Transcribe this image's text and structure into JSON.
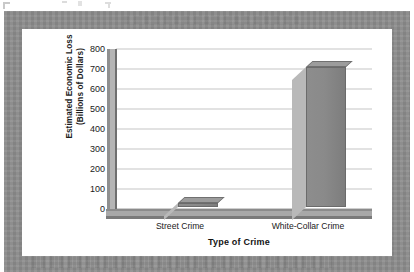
{
  "chart_data": {
    "type": "bar",
    "title": "",
    "categories": [
      "Street Crime",
      "White-Collar Crime"
    ],
    "values": [
      18,
      700
    ],
    "series": [
      {
        "name": "Estimated Economic Loss",
        "values": [
          18,
          700
        ]
      }
    ],
    "xlabel": "Type of Crime",
    "ylabel": "Estimated Economic Loss (Billions of Dollars)",
    "ylabel_lines": [
      "Estimated Economic Loss",
      "(Billions of Dollars)"
    ],
    "ylim": [
      0,
      800
    ],
    "ytick_labels": [
      "800",
      "700",
      "600",
      "500",
      "400",
      "300",
      "200",
      "100",
      "0"
    ],
    "ytick_values": [
      800,
      700,
      600,
      500,
      400,
      300,
      200,
      100,
      0
    ],
    "ytick_step": 100,
    "grid": "horizontal",
    "legend": "none",
    "style": "3d-column",
    "units": "Billions of Dollars",
    "bar_color": "#8a8a8a",
    "bar_top_color": "#9c9c9c",
    "bar_shadow_color": "#b9b9b9",
    "gridline_color": "#c6c6c6",
    "axis_color": "#7a7a7a",
    "plot_background": "#ffffff"
  },
  "frame": {
    "border_color": "#8c8c8c",
    "panel_color": "#ffffff"
  }
}
